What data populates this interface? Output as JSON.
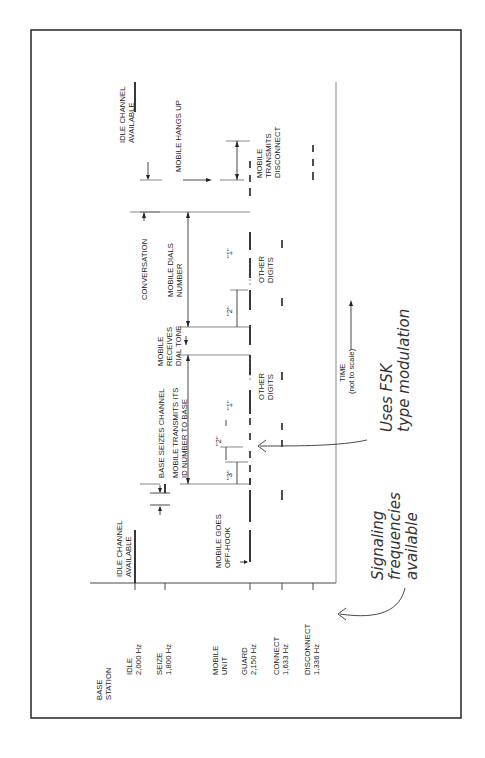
{
  "figure": {
    "orientation": "rotated 90 degrees counter-clockwise",
    "colors": {
      "ink": "#222222",
      "paper": "#ffffff",
      "frame": "#333333"
    },
    "rows": {
      "base_station_label": [
        "BASE",
        "STATION"
      ],
      "idle": [
        "IDLE",
        "2,000 Hz"
      ],
      "seize": [
        "SEIZE",
        "1,800 Hz"
      ],
      "mobile_unit_label": [
        "MOBILE",
        "UNIT"
      ],
      "guard": [
        "GUARD",
        "2,150 Hz"
      ],
      "connect": [
        "CONNECT",
        "1,633 Hz"
      ],
      "disconnect": [
        "DISCONNECT",
        "1,336 Hz"
      ]
    },
    "events": {
      "idle_start": [
        "IDLE CHANNEL",
        "AVAILABLE"
      ],
      "off_hook": [
        "MOBILE GOES",
        "OFF-HOOK"
      ],
      "base_seizes": "BASE SEIZES CHANNEL",
      "transmit_id": [
        "MOBILE TRANSMITS ITS",
        "ID NUMBER TO BASE"
      ],
      "digit_3": "\"3\"",
      "digit_2a": "\"2\"",
      "digit_1a": "\"1\"",
      "other_digits_a": [
        "OTHER",
        "DIGITS"
      ],
      "dial_tone": [
        "MOBILE",
        "RECEIVES",
        "DIAL TONE"
      ],
      "conversation": "CONVERSATION",
      "dials_number": [
        "MOBILE DIALS",
        "NUMBER"
      ],
      "digit_2b": "\"2\"",
      "digit_1b": "\"1\"",
      "other_digits_b": [
        "OTHER",
        "DIGITS"
      ],
      "hangs_up": "MOBILE HANGS UP",
      "transmits_disconnect": [
        "MOBILE",
        "TRANSMITS",
        "DISCONNECT"
      ],
      "idle_end": [
        "IDLE CHANNEL",
        "AVAILABLE"
      ]
    },
    "axis": {
      "time_label": "TIME",
      "time_note": "(not to scale)"
    },
    "annotations": {
      "fsk": [
        "Uses FSK",
        "type modulation"
      ],
      "freqs": [
        "Signaling",
        "frequencies",
        "available"
      ]
    }
  }
}
